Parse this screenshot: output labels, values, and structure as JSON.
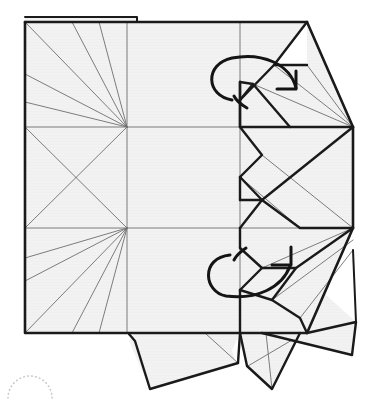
{
  "figure": {
    "title": "Origami crease pattern with twist-fold arrows",
    "type": "origami-crease-pattern",
    "width": 371,
    "height": 404,
    "background_color": "#ffffff"
  },
  "style": {
    "paper_fill": "#f2f2f2",
    "paper_fill_alt": "#efefef",
    "white_fill": "#ffffff",
    "edge_color": "#1a1a1a",
    "crease_color": "#6e6e6e",
    "crease_color_light": "#9a9a9a",
    "arrow_color": "#141414",
    "dotted_color": "#c9c9c9",
    "edge_width": 2.6,
    "fold_width": 2.4,
    "crease_width": 0.9,
    "crease_width_light": 0.7,
    "arrow_width": 3.0
  },
  "geometry": {
    "grid": {
      "left": 25,
      "mid_x": 127,
      "right_inner": 240,
      "top": 22,
      "mid_y": 127,
      "lower_y": 228,
      "bottom": 333,
      "right_edge": 353
    },
    "vertices": {
      "top_left": [
        25,
        22
      ],
      "top_mid": [
        127,
        22
      ],
      "top_right_inner": [
        240,
        22
      ],
      "apex_top": [
        307,
        22
      ],
      "mid_left": [
        25,
        127
      ],
      "center_left": [
        127,
        127
      ],
      "right_mid_upper": [
        353,
        127
      ],
      "lower_left": [
        25,
        228
      ],
      "center_lower": [
        127,
        228
      ],
      "right_mid_lower": [
        353,
        228
      ],
      "bottom_left": [
        25,
        333
      ],
      "bottom_mid": [
        127,
        333
      ],
      "bottom_inner": [
        240,
        333
      ],
      "apex_bottom": [
        307,
        333
      ]
    }
  },
  "panels": {
    "main_sheet_label": "main-square-sheet",
    "top_strip_label": "top-edge-strip",
    "white_triangle_label": "white-notch-triangle",
    "bottom_flap_left_label": "bottom-flap-left",
    "bottom_flap_right_label": "bottom-flap-right",
    "right_wing_upper_label": "right-wing-upper",
    "right_wing_lower_label": "right-wing-lower"
  },
  "annotations": {
    "arrow_upper": {
      "name": "twist-arrow-upper",
      "kind": "rotate-twist-arrow",
      "direction": "clockwise",
      "center": [
        258,
        92
      ]
    },
    "arrow_lower": {
      "name": "twist-arrow-lower",
      "kind": "rotate-twist-arrow",
      "direction": "clockwise",
      "center": [
        250,
        278
      ]
    },
    "dotted_arc": {
      "name": "dotted-reference-arc",
      "kind": "dotted-arc",
      "center": [
        30,
        392
      ],
      "radius": 22
    }
  },
  "caption": {
    "text": ""
  }
}
